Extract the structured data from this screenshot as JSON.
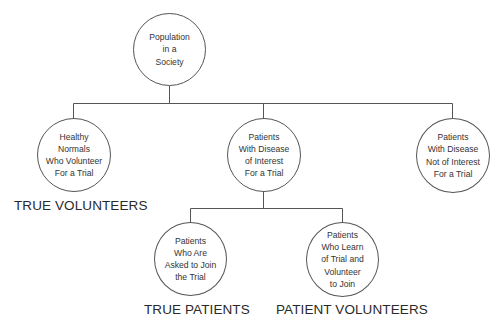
{
  "diagram": {
    "type": "tree",
    "nodes": {
      "root": {
        "label": "Population\nin a\nSociety"
      },
      "healthy": {
        "label": "Healthy\nNormals\nWho Volunteer\nFor a Trial"
      },
      "disease_interest": {
        "label": "Patients\nWith Disease\nof Interest\nFor a Trial"
      },
      "disease_not_interest": {
        "label": "Patients\nWith Disease\nNot of Interest\nFor a Trial"
      },
      "asked": {
        "label": "Patients\nWho Are\nAsked to Join\nthe Trial"
      },
      "learn": {
        "label": "Patients\nWho Learn\nof Trial and\nVolunteer\nto Join"
      }
    },
    "edges": [
      [
        "root",
        "healthy"
      ],
      [
        "root",
        "disease_interest"
      ],
      [
        "root",
        "disease_not_interest"
      ],
      [
        "disease_interest",
        "asked"
      ],
      [
        "disease_interest",
        "learn"
      ]
    ],
    "captions": {
      "true_volunteers": "TRUE VOLUNTEERS",
      "true_patients": "TRUE PATIENTS",
      "patient_volunteers": "PATIENT VOLUNTEERS"
    },
    "colors": {
      "line": "#555555",
      "text": "#2a2a2a",
      "background": "#ffffff"
    }
  }
}
